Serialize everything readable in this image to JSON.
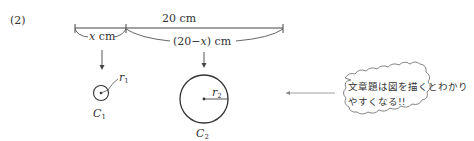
{
  "problem_number": "(2)",
  "total_length": {
    "label": "20 cm"
  },
  "segment_left": {
    "var": "x",
    "unit": " cm"
  },
  "segment_right": {
    "open": "(20",
    "minus": "−",
    "var": "x",
    "close": ") cm"
  },
  "circle_small": {
    "radius_var": "r",
    "radius_sub": "1",
    "name": "C",
    "name_sub": "1"
  },
  "circle_large": {
    "radius_var": "r",
    "radius_sub": "2",
    "name": "C",
    "name_sub": "2"
  },
  "callout": {
    "line1": "文章題は図を描くとわかり",
    "line2": "やすくなる!!"
  }
}
